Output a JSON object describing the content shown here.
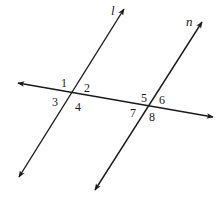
{
  "diagram": {
    "colors": {
      "stroke": "#1a1a1a",
      "background": "#ffffff"
    },
    "lines": [
      {
        "id": "l",
        "label": "l",
        "x1": 19,
        "y1": 177,
        "x2": 124,
        "y2": 9,
        "label_x": 111,
        "label_y": 15
      },
      {
        "id": "n",
        "label": "n",
        "x1": 95,
        "y1": 190,
        "x2": 202,
        "y2": 22,
        "label_x": 186,
        "label_y": 26
      },
      {
        "id": "transversal",
        "label": "",
        "x1": 18,
        "y1": 83,
        "x2": 213,
        "y2": 117
      }
    ],
    "intersections": [
      {
        "lines": [
          "l",
          "transversal"
        ],
        "x": 71,
        "y": 94
      },
      {
        "lines": [
          "n",
          "transversal"
        ],
        "x": 147,
        "y": 106
      }
    ],
    "angles": [
      {
        "label": "1",
        "x": 61,
        "y": 87
      },
      {
        "label": "2",
        "x": 84,
        "y": 92
      },
      {
        "label": "3",
        "x": 52,
        "y": 106
      },
      {
        "label": "4",
        "x": 75,
        "y": 111
      },
      {
        "label": "5",
        "x": 141,
        "y": 102
      },
      {
        "label": "6",
        "x": 159,
        "y": 104
      },
      {
        "label": "7",
        "x": 130,
        "y": 117
      },
      {
        "label": "8",
        "x": 149,
        "y": 121
      }
    ]
  }
}
